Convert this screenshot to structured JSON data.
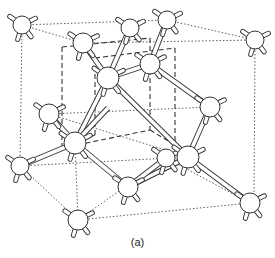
{
  "figure": {
    "caption": "(a)",
    "colors": {
      "background": "#ffffff",
      "line": "#333333",
      "atom_fill": "#ffffff"
    }
  },
  "atoms": [
    {
      "id": "corner-top-left",
      "x": 22,
      "y": 25,
      "r": 9
    },
    {
      "id": "inner-top-left",
      "x": 83,
      "y": 43,
      "r": 10
    },
    {
      "id": "top-back-middle",
      "x": 130,
      "y": 28,
      "r": 9
    },
    {
      "id": "top-back-right",
      "x": 167,
      "y": 20,
      "r": 9
    },
    {
      "id": "corner-top-right",
      "x": 255,
      "y": 40,
      "r": 9
    },
    {
      "id": "center-upper",
      "x": 108,
      "y": 78,
      "r": 11
    },
    {
      "id": "upper-right-inner",
      "x": 150,
      "y": 64,
      "r": 10
    },
    {
      "id": "left-middle",
      "x": 49,
      "y": 114,
      "r": 10
    },
    {
      "id": "center-left-lower",
      "x": 75,
      "y": 143,
      "r": 11
    },
    {
      "id": "right-middle",
      "x": 210,
      "y": 107,
      "r": 10
    },
    {
      "id": "back-lower-small",
      "x": 166,
      "y": 158,
      "r": 9
    },
    {
      "id": "center-lower-right",
      "x": 188,
      "y": 157,
      "r": 11
    },
    {
      "id": "corner-lower-left",
      "x": 20,
      "y": 166,
      "r": 9
    },
    {
      "id": "bottom-center",
      "x": 128,
      "y": 187,
      "r": 10
    },
    {
      "id": "corner-bottom-front",
      "x": 78,
      "y": 220,
      "r": 10
    },
    {
      "id": "corner-bottom-right",
      "x": 250,
      "y": 203,
      "r": 10
    },
    {
      "id": "mid-upper-right",
      "x": 108,
      "y": 108,
      "r": 0
    }
  ],
  "bonds": [
    [
      83,
      43,
      108,
      78
    ],
    [
      130,
      28,
      108,
      78
    ],
    [
      108,
      78,
      150,
      64
    ],
    [
      108,
      78,
      75,
      143
    ],
    [
      150,
      64,
      167,
      20
    ],
    [
      150,
      64,
      210,
      107
    ],
    [
      108,
      78,
      188,
      157
    ],
    [
      49,
      114,
      75,
      143
    ],
    [
      75,
      143,
      20,
      166
    ],
    [
      75,
      143,
      128,
      187
    ],
    [
      210,
      107,
      188,
      157
    ],
    [
      188,
      157,
      250,
      203
    ],
    [
      188,
      157,
      128,
      187
    ],
    [
      128,
      187,
      166,
      158
    ],
    [
      75,
      143,
      108,
      108
    ]
  ],
  "dotted_lines": [
    [
      22,
      25,
      167,
      20
    ],
    [
      167,
      20,
      255,
      40
    ],
    [
      22,
      25,
      83,
      43
    ],
    [
      22,
      25,
      20,
      166
    ],
    [
      255,
      40,
      254,
      203
    ],
    [
      20,
      166,
      78,
      220
    ],
    [
      78,
      220,
      250,
      203
    ],
    [
      20,
      166,
      188,
      157
    ],
    [
      83,
      43,
      255,
      40
    ],
    [
      49,
      114,
      210,
      107
    ],
    [
      75,
      143,
      78,
      220
    ],
    [
      78,
      220,
      166,
      158
    ],
    [
      166,
      158,
      250,
      203
    ],
    [
      49,
      114,
      188,
      157
    ]
  ],
  "dashed_cube": [
    [
      62,
      47,
      150,
      38
    ],
    [
      150,
      38,
      150,
      130
    ],
    [
      62,
      47,
      62,
      148
    ],
    [
      62,
      148,
      150,
      130
    ],
    [
      95,
      58,
      175,
      48
    ],
    [
      175,
      48,
      175,
      145
    ],
    [
      95,
      58,
      95,
      135
    ],
    [
      62,
      148,
      95,
      135
    ],
    [
      150,
      130,
      175,
      145
    ]
  ]
}
